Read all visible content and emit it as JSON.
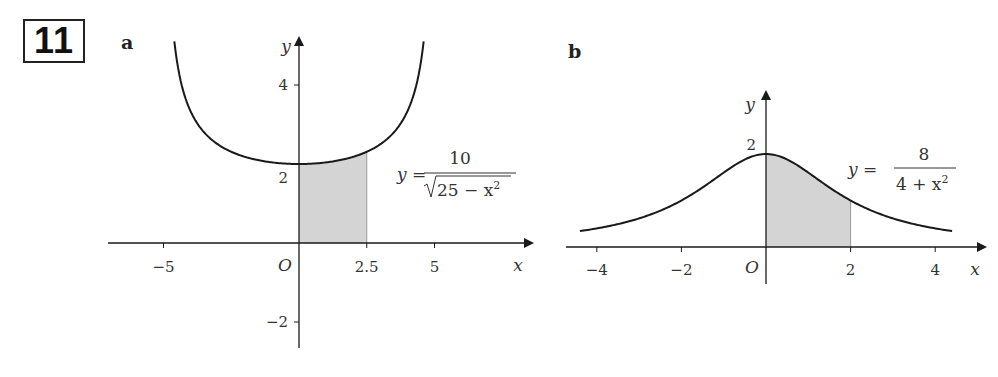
{
  "question": {
    "number": "11"
  },
  "parts": [
    {
      "label": "a"
    },
    {
      "label": "b"
    }
  ],
  "chart_data": [
    {
      "type": "line",
      "part": "a",
      "function": "y = 10 / sqrt(25 - x^2)",
      "equation_label": {
        "lhs": "y =",
        "numerator": "10",
        "denominator_radicand": "25 − x",
        "denominator_exp": "2"
      },
      "xlabel": "x",
      "ylabel": "y",
      "origin_label": "O",
      "x_ticks": [
        {
          "value": -5,
          "label": "−5"
        },
        {
          "value": 2.5,
          "label": "2.5"
        },
        {
          "value": 5,
          "label": "5"
        }
      ],
      "y_ticks": [
        {
          "value": 4,
          "label": "4"
        },
        {
          "value": 2,
          "label": "2"
        },
        {
          "value": -2,
          "label": "−2"
        }
      ],
      "xlim": [
        -6.3,
        8.6
      ],
      "ylim": [
        -2.7,
        5.2
      ],
      "curve_domain": [
        -4.6,
        4.6
      ],
      "shaded_region": {
        "from": 0,
        "to": 2.5,
        "color": "#d4d4d4"
      },
      "curve_color": "#1a1a1a"
    },
    {
      "type": "line",
      "part": "b",
      "function": "y = 8 / (4 + x^2)",
      "equation_label": {
        "lhs": "y =",
        "numerator": "8",
        "denominator": "4 + x",
        "denominator_exp": "2"
      },
      "xlabel": "x",
      "ylabel": "y",
      "origin_label": "O",
      "x_ticks": [
        {
          "value": -4,
          "label": "−4"
        },
        {
          "value": -2,
          "label": "−2"
        },
        {
          "value": 2,
          "label": "2"
        },
        {
          "value": 4,
          "label": "4"
        }
      ],
      "y_ticks": [
        {
          "value": 2,
          "label": "2"
        }
      ],
      "xlim": [
        -4.5,
        5.0
      ],
      "ylim": [
        -0.4,
        2.4
      ],
      "curve_domain": [
        -4.4,
        4.4
      ],
      "shaded_region": {
        "from": 0,
        "to": 2,
        "color": "#d4d4d4"
      },
      "curve_color": "#1a1a1a"
    }
  ]
}
